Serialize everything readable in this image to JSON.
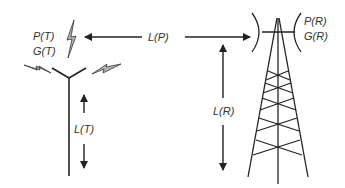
{
  "diagram": {
    "type": "radio link budget diagram",
    "transmitter": {
      "power_label": "P(T)",
      "gain_label": "G(T)",
      "height_label": "L(T)"
    },
    "path_label": "L(P)",
    "receiver": {
      "power_label": "P(R)",
      "gain_label": "G(R)",
      "height_label": "L(R)"
    },
    "colors": {
      "line": "#222222",
      "bolt_fill": "#aaaaaa",
      "text": "#333333"
    }
  }
}
